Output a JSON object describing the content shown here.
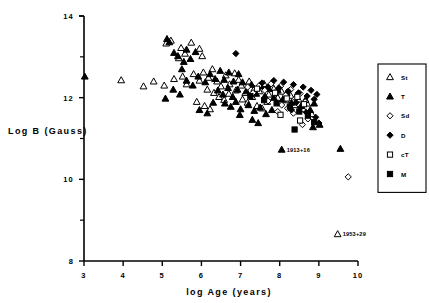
{
  "chart_data": {
    "type": "scatter",
    "title": "",
    "xlabel": "log Age (years)",
    "ylabel": "Log B (Gauss)",
    "xlim": [
      3,
      10
    ],
    "ylim": [
      8,
      14
    ],
    "xticks": [
      "3",
      "4",
      "5",
      "6",
      "7",
      "8",
      "9",
      "10"
    ],
    "yticks": [
      "14",
      "12",
      "10",
      "8"
    ],
    "yticks_minor": [
      13,
      11,
      9
    ],
    "grid": false,
    "legend_position": "right",
    "legend": [
      {
        "key": "St",
        "label": "St",
        "marker": "open-triangle"
      },
      {
        "key": "T",
        "label": "T",
        "marker": "filled-triangle"
      },
      {
        "key": "Sd",
        "label": "Sd",
        "marker": "open-diamond"
      },
      {
        "key": "D",
        "label": "D",
        "marker": "filled-diamond"
      },
      {
        "key": "cT",
        "label": "cT",
        "marker": "open-square"
      },
      {
        "key": "M",
        "label": "M",
        "marker": "filled-square"
      }
    ],
    "annotations": [
      {
        "text": "1913+16",
        "marker": "filled-triangle",
        "x": 8.05,
        "y": 10.73
      },
      {
        "text": "1953+29",
        "marker": "open-triangle",
        "x": 9.48,
        "y": 8.66
      }
    ],
    "series": [
      {
        "name": "St",
        "marker": "open-triangle",
        "points": [
          [
            3.95,
            12.43
          ],
          [
            4.78,
            12.4
          ],
          [
            5.1,
            13.33
          ],
          [
            5.22,
            13.4
          ],
          [
            5.48,
            13.22
          ],
          [
            5.42,
            12.97
          ],
          [
            5.58,
            13.08
          ],
          [
            5.74,
            13.35
          ],
          [
            5.95,
            13.2
          ],
          [
            6.02,
            13.02
          ],
          [
            4.52,
            12.28
          ],
          [
            5.05,
            12.3
          ],
          [
            5.3,
            12.46
          ],
          [
            5.52,
            12.52
          ],
          [
            5.62,
            12.33
          ],
          [
            5.8,
            12.58
          ],
          [
            5.95,
            12.42
          ],
          [
            6.05,
            12.62
          ],
          [
            6.18,
            12.49
          ],
          [
            6.28,
            12.7
          ],
          [
            6.4,
            12.4
          ],
          [
            6.15,
            12.2
          ],
          [
            6.32,
            12.12
          ],
          [
            6.5,
            12.28
          ],
          [
            6.62,
            12.55
          ],
          [
            6.72,
            12.33
          ],
          [
            6.85,
            12.6
          ],
          [
            6.95,
            12.44
          ],
          [
            6.45,
            12.02
          ],
          [
            6.58,
            11.95
          ],
          [
            6.7,
            12.1
          ],
          [
            6.88,
            12.18
          ],
          [
            7.02,
            12.3
          ],
          [
            7.12,
            12.12
          ],
          [
            7.22,
            12.4
          ],
          [
            7.35,
            12.22
          ],
          [
            7.05,
            11.96
          ],
          [
            7.18,
            11.88
          ],
          [
            7.3,
            12.02
          ],
          [
            7.48,
            12.16
          ],
          [
            7.6,
            12.34
          ],
          [
            7.72,
            12.08
          ],
          [
            7.85,
            12.22
          ],
          [
            7.95,
            12.0
          ],
          [
            8.05,
            12.15
          ],
          [
            7.42,
            11.8
          ],
          [
            7.55,
            11.74
          ],
          [
            7.68,
            11.9
          ],
          [
            8.15,
            11.94
          ],
          [
            8.28,
            12.05
          ],
          [
            8.38,
            11.82
          ],
          [
            8.48,
            11.96
          ],
          [
            8.6,
            11.72
          ],
          [
            8.7,
            11.86
          ],
          [
            8.82,
            11.6
          ],
          [
            6.08,
            11.8
          ],
          [
            6.22,
            11.72
          ],
          [
            5.88,
            11.9
          ]
        ]
      },
      {
        "name": "T",
        "marker": "filled-triangle",
        "points": [
          [
            3.02,
            12.52
          ],
          [
            5.12,
            13.44
          ],
          [
            5.18,
            13.36
          ],
          [
            5.3,
            13.1
          ],
          [
            5.4,
            13.02
          ],
          [
            5.55,
            12.88
          ],
          [
            5.62,
            13.18
          ],
          [
            5.72,
            12.95
          ],
          [
            5.85,
            13.12
          ],
          [
            5.5,
            12.7
          ],
          [
            5.28,
            12.2
          ],
          [
            5.45,
            12.08
          ],
          [
            5.08,
            11.98
          ],
          [
            5.62,
            12.42
          ],
          [
            5.78,
            12.3
          ],
          [
            5.92,
            12.52
          ],
          [
            6.1,
            12.38
          ],
          [
            6.22,
            12.58
          ],
          [
            6.35,
            12.46
          ],
          [
            6.48,
            12.66
          ],
          [
            6.58,
            12.44
          ],
          [
            6.7,
            12.62
          ],
          [
            6.82,
            12.4
          ],
          [
            6.95,
            12.58
          ],
          [
            6.42,
            12.18
          ],
          [
            6.55,
            12.08
          ],
          [
            6.68,
            12.24
          ],
          [
            6.8,
            12.02
          ],
          [
            6.92,
            12.2
          ],
          [
            7.05,
            12.38
          ],
          [
            7.15,
            12.16
          ],
          [
            7.28,
            12.32
          ],
          [
            7.4,
            12.1
          ],
          [
            7.52,
            12.28
          ],
          [
            7.62,
            12.04
          ],
          [
            7.72,
            12.22
          ],
          [
            7.85,
            12.0
          ],
          [
            7.95,
            12.18
          ],
          [
            8.08,
            11.96
          ],
          [
            8.18,
            12.12
          ],
          [
            8.3,
            11.88
          ],
          [
            8.42,
            12.04
          ],
          [
            8.55,
            11.8
          ],
          [
            8.66,
            11.95
          ],
          [
            8.78,
            11.7
          ],
          [
            8.88,
            11.86
          ],
          [
            6.6,
            11.86
          ],
          [
            6.75,
            11.78
          ],
          [
            6.88,
            11.9
          ],
          [
            7.0,
            11.72
          ],
          [
            7.2,
            11.82
          ],
          [
            7.35,
            11.68
          ],
          [
            7.5,
            11.76
          ],
          [
            7.65,
            11.6
          ],
          [
            7.8,
            11.7
          ],
          [
            9.55,
            10.75
          ],
          [
            9.02,
            11.34
          ],
          [
            7.3,
            11.46
          ],
          [
            7.45,
            11.38
          ],
          [
            6.98,
            11.58
          ],
          [
            5.95,
            11.7
          ],
          [
            6.15,
            11.62
          ],
          [
            6.3,
            11.88
          ],
          [
            8.85,
            11.28
          ]
        ]
      },
      {
        "name": "Sd",
        "marker": "open-diamond",
        "points": [
          [
            7.18,
            12.26
          ],
          [
            7.32,
            12.12
          ],
          [
            7.48,
            12.3
          ],
          [
            7.62,
            12.18
          ],
          [
            7.78,
            12.34
          ],
          [
            7.9,
            12.14
          ],
          [
            8.02,
            12.28
          ],
          [
            8.15,
            12.06
          ],
          [
            8.28,
            12.2
          ],
          [
            8.4,
            11.98
          ],
          [
            8.52,
            12.1
          ],
          [
            8.65,
            11.9
          ],
          [
            8.05,
            11.82
          ],
          [
            8.2,
            11.74
          ],
          [
            7.95,
            11.66
          ],
          [
            8.35,
            11.62
          ],
          [
            8.72,
            11.48
          ],
          [
            9.75,
            10.06
          ],
          [
            8.58,
            11.34
          ],
          [
            7.7,
            11.92
          ]
        ]
      },
      {
        "name": "D",
        "marker": "filled-diamond",
        "points": [
          [
            6.88,
            13.08
          ],
          [
            7.55,
            12.36
          ],
          [
            7.7,
            12.26
          ],
          [
            7.85,
            12.42
          ],
          [
            7.98,
            12.24
          ],
          [
            8.1,
            12.38
          ],
          [
            8.22,
            12.16
          ],
          [
            8.35,
            12.32
          ],
          [
            8.48,
            12.12
          ],
          [
            8.6,
            12.26
          ],
          [
            8.7,
            12.04
          ],
          [
            8.8,
            12.18
          ],
          [
            8.88,
            11.96
          ],
          [
            8.95,
            12.08
          ],
          [
            8.42,
            11.88
          ],
          [
            8.55,
            11.78
          ],
          [
            8.3,
            11.7
          ],
          [
            8.68,
            11.64
          ],
          [
            8.92,
            11.52
          ],
          [
            9.0,
            11.38
          ]
        ]
      },
      {
        "name": "cT",
        "marker": "open-square",
        "points": [
          [
            7.42,
            12.22
          ],
          [
            7.88,
            12.12
          ],
          [
            8.18,
            11.98
          ],
          [
            8.45,
            12.02
          ],
          [
            8.62,
            11.84
          ],
          [
            8.02,
            11.58
          ],
          [
            8.52,
            11.44
          ]
        ]
      },
      {
        "name": "M",
        "marker": "filled-square",
        "points": [
          [
            7.25,
            12.04
          ],
          [
            7.6,
            11.94
          ],
          [
            7.92,
            11.86
          ],
          [
            8.26,
            11.78
          ],
          [
            8.5,
            11.66
          ],
          [
            8.72,
            11.56
          ],
          [
            8.38,
            11.22
          ],
          [
            8.88,
            11.4
          ]
        ]
      }
    ]
  }
}
